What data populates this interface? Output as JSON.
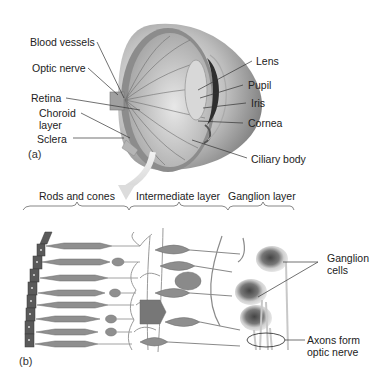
{
  "figure": {
    "panel_a": {
      "tag": "(a)",
      "labels_left": {
        "blood_vessels": "Blood vessels",
        "optic_nerve": "Optic nerve",
        "retina": "Retina",
        "choroid_line1": "Choroid",
        "choroid_line2": "layer",
        "sclera": "Sclera"
      },
      "labels_right": {
        "lens": "Lens",
        "pupil": "Pupil",
        "iris": "Iris",
        "cornea": "Cornea",
        "ciliary_body": "Ciliary body"
      }
    },
    "panel_b": {
      "tag": "(b)",
      "layers": {
        "rods_cones": "Rods and cones",
        "intermediate": "Intermediate layer",
        "ganglion": "Ganglion layer"
      },
      "labels": {
        "ganglion_line1": "Ganglion",
        "ganglion_line2": "cells",
        "axons_line1": "Axons form",
        "axons_line2": "optic nerve"
      }
    }
  },
  "colors": {
    "background": "#ffffff",
    "text": "#222222",
    "leader_line": "#333333",
    "eye_shell": "#8a8a8a",
    "eye_interior": "#d4d4d4",
    "cell_fill": "#9a9a9a",
    "cell_stroke": "#6a6a6a",
    "arrow": "#e0e0e0"
  }
}
